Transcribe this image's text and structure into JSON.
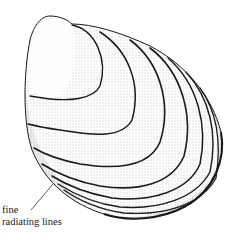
{
  "figure": {
    "style": "stippled pen-and-ink illustration",
    "colors": {
      "ink": "#1a1a1a",
      "paper": "#ffffff",
      "label_text": "#222222"
    }
  },
  "annotations": [
    {
      "id": "fine-radiating-lines",
      "lines": [
        "fine",
        "radiating lines"
      ],
      "has_leader_line": true
    }
  ]
}
